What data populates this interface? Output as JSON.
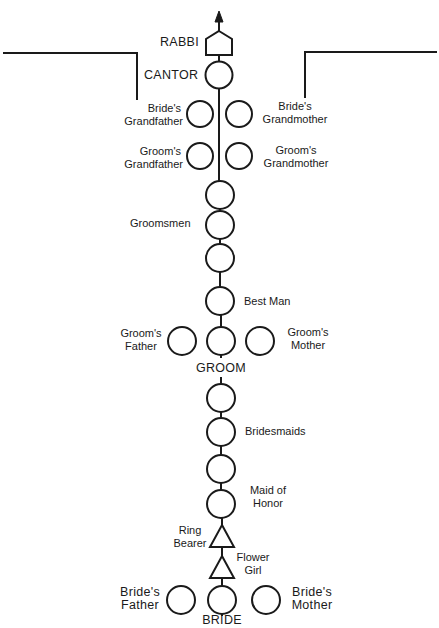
{
  "diagram": {
    "type": "jewish-wedding-processional",
    "direction": "upward toward officiant",
    "colors": {
      "line": "#1a1a1a",
      "background": "#ffffff"
    },
    "officiants": {
      "rabbi": {
        "label": "RABBI",
        "shape": "pentagon"
      },
      "cantor": {
        "label": "CANTOR",
        "shape": "circle"
      }
    },
    "grandparents": {
      "brides_grandfather": {
        "line1": "Bride's",
        "line2": "Grandfather"
      },
      "brides_grandmother": {
        "line1": "Bride's",
        "line2": "Grandmother"
      },
      "grooms_grandfather": {
        "line1": "Groom's",
        "line2": "Grandfather"
      },
      "grooms_grandmother": {
        "line1": "Groom's",
        "line2": "Grandmother"
      }
    },
    "groomsmen": {
      "label": "Groomsmen",
      "count": 3
    },
    "best_man": {
      "label": "Best Man"
    },
    "groom_party": {
      "groom": {
        "label": "GROOM"
      },
      "father": {
        "line1": "Groom's",
        "line2": "Father"
      },
      "mother": {
        "line1": "Groom's",
        "line2": "Mother"
      }
    },
    "bridesmaids": {
      "label": "Bridesmaids",
      "count": 2
    },
    "maid_of_honor": {
      "line1": "Maid of",
      "line2": "Honor"
    },
    "ring_bearer": {
      "line1": "Ring",
      "line2": "Bearer",
      "shape": "triangle"
    },
    "flower_girl": {
      "line1": "Flower",
      "line2": "Girl",
      "shape": "triangle"
    },
    "bride_party": {
      "bride": {
        "label": "BRIDE"
      },
      "father": {
        "line1": "Bride's",
        "line2": "Father"
      },
      "mother": {
        "line1": "Bride's",
        "line2": "Mother"
      }
    },
    "legend": {
      "circle": "person",
      "triangle": "child",
      "pentagon": "officiant / rabbi",
      "arrow": "facing direction"
    }
  }
}
